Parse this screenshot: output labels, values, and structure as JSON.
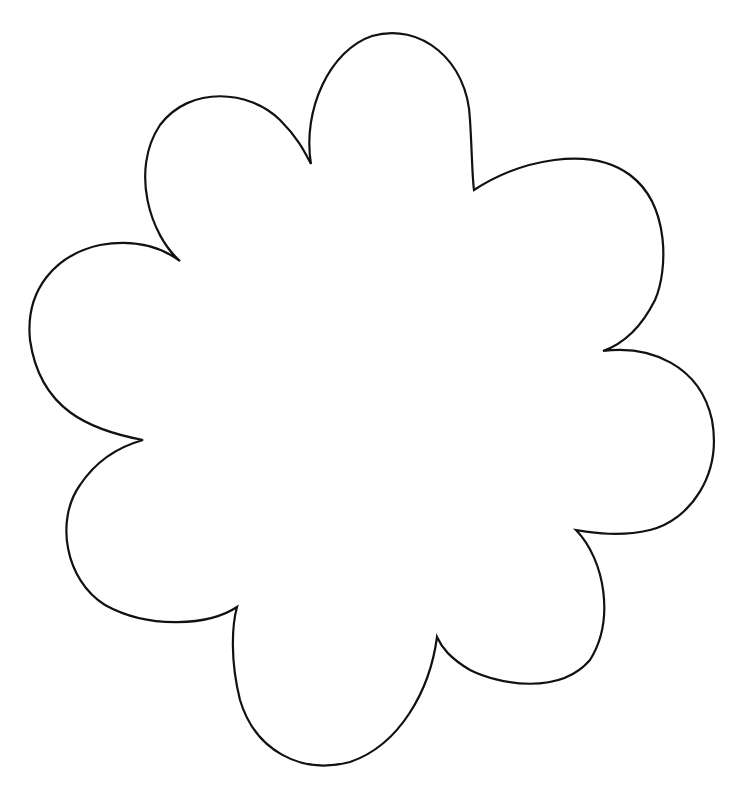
{
  "drawing": {
    "subject": "flower-outline",
    "petal_count": 8,
    "stroke_color": "#111111",
    "fill_color": "#ffffff",
    "background_color": "#ffffff"
  }
}
